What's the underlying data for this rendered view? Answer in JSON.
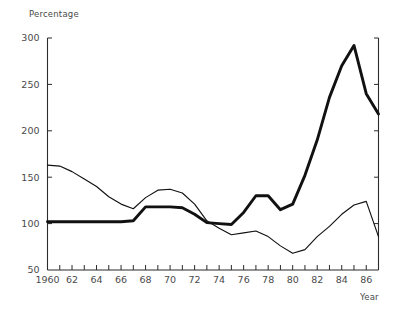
{
  "chart_data": {
    "type": "line",
    "title": "",
    "xlabel": "Year",
    "ylabel": "Percentage",
    "xlim": [
      1960,
      1987
    ],
    "ylim": [
      50,
      300
    ],
    "grid": false,
    "legend": "none",
    "y_ticks": [
      50,
      100,
      150,
      200,
      250,
      300
    ],
    "y_tick_labels": [
      "50",
      "100",
      "150",
      "200",
      "250",
      "300"
    ],
    "x_ticks": [
      1960,
      1961,
      1962,
      1963,
      1964,
      1965,
      1966,
      1967,
      1968,
      1969,
      1970,
      1971,
      1972,
      1973,
      1974,
      1975,
      1976,
      1977,
      1978,
      1979,
      1980,
      1981,
      1982,
      1983,
      1984,
      1985,
      1986,
      1987
    ],
    "x_tick_labels": [
      "1960",
      "",
      "62",
      "",
      "64",
      "",
      "66",
      "",
      "68",
      "",
      "70",
      "",
      "72",
      "",
      "74",
      "",
      "76",
      "",
      "78",
      "",
      "80",
      "",
      "82",
      "",
      "84",
      "",
      "86",
      ""
    ],
    "x": [
      1960,
      1961,
      1962,
      1963,
      1964,
      1965,
      1966,
      1967,
      1968,
      1969,
      1970,
      1971,
      1972,
      1973,
      1974,
      1975,
      1976,
      1977,
      1978,
      1979,
      1980,
      1981,
      1982,
      1983,
      1984,
      1985,
      1986,
      1987
    ],
    "series": [
      {
        "name": "thick-series",
        "style": "thick",
        "color": "#111111",
        "values": [
          102,
          102,
          102,
          102,
          102,
          102,
          102,
          103,
          118,
          118,
          118,
          117,
          110,
          101,
          100,
          99,
          112,
          130,
          130,
          115,
          121,
          152,
          190,
          236,
          270,
          292,
          240,
          218
        ]
      },
      {
        "name": "thin-series",
        "style": "thin",
        "color": "#111111",
        "values": [
          163,
          162,
          156,
          148,
          140,
          129,
          121,
          116,
          128,
          136,
          137,
          133,
          121,
          103,
          95,
          88,
          90,
          92,
          86,
          76,
          68,
          72,
          86,
          97,
          110,
          120,
          124,
          86
        ]
      }
    ]
  },
  "axes": {
    "y_axis_title": "Percentage",
    "x_axis_title": "Year"
  }
}
